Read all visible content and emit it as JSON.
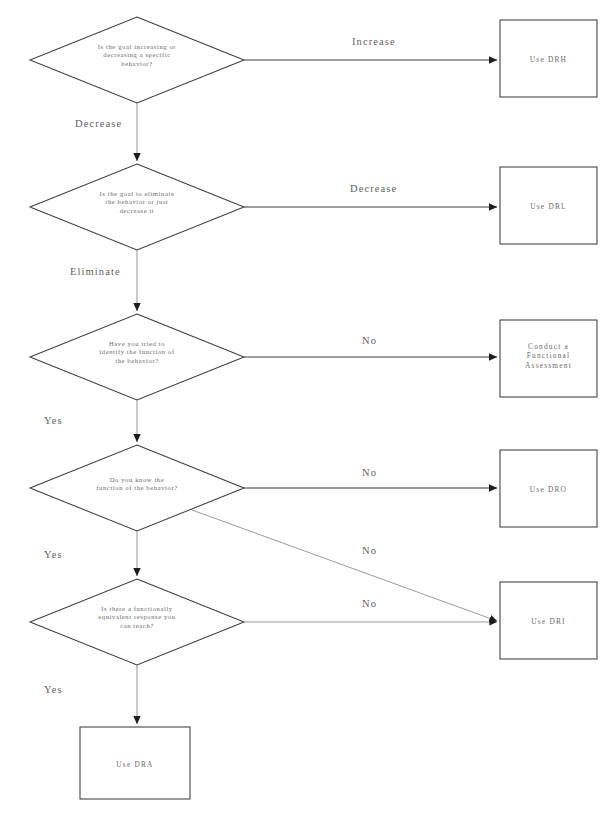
{
  "diagram": {
    "type": "flowchart",
    "stroke_color": "#3d3d3d",
    "thin_stroke_color": "#8a8a8a",
    "text_color": "#6b6b6b",
    "background": "#ffffff",
    "decisions": [
      {
        "id": "d1",
        "lines": [
          "Is the goal increasing or",
          "decreasing a specific",
          "behavior?"
        ],
        "cx": 137,
        "cy": 60,
        "rx": 107,
        "ry": 43
      },
      {
        "id": "d2",
        "lines": [
          "Is the goal to eliminate",
          "the behavior or just",
          "decrease it"
        ],
        "cx": 137,
        "cy": 207,
        "rx": 107,
        "ry": 43
      },
      {
        "id": "d3",
        "lines": [
          "Have you tried to",
          "identify the function of",
          "the behavior?"
        ],
        "cx": 137,
        "cy": 357,
        "rx": 107,
        "ry": 43
      },
      {
        "id": "d4",
        "lines": [
          "Do you know the",
          "function of the behavior?"
        ],
        "cx": 137,
        "cy": 488,
        "rx": 107,
        "ry": 43
      },
      {
        "id": "d5",
        "lines": [
          "Is there a functionally",
          "equivalent response you",
          "can teach?"
        ],
        "cx": 137,
        "cy": 622,
        "rx": 107,
        "ry": 43
      }
    ],
    "outcomes": [
      {
        "id": "o1",
        "lines": [
          "Use DRH"
        ],
        "x": 500,
        "y": 20,
        "w": 97,
        "h": 77
      },
      {
        "id": "o2",
        "lines": [
          "Use DRL"
        ],
        "x": 500,
        "y": 167,
        "w": 97,
        "h": 77
      },
      {
        "id": "o3",
        "lines": [
          "Conduct a",
          "Functional",
          "Assessment"
        ],
        "x": 500,
        "y": 320,
        "w": 97,
        "h": 77
      },
      {
        "id": "o4",
        "lines": [
          "Use DRO"
        ],
        "x": 500,
        "y": 450,
        "w": 97,
        "h": 77
      },
      {
        "id": "o5",
        "lines": [
          "Use DRI"
        ],
        "x": 500,
        "y": 582,
        "w": 97,
        "h": 77
      },
      {
        "id": "o6",
        "lines": [
          "Use DRA"
        ],
        "x": 80,
        "y": 727,
        "w": 110,
        "h": 72
      }
    ],
    "edge_labels": [
      {
        "id": "e1",
        "text": "Increase",
        "x": 352,
        "y": 36,
        "orientation": "horizontal"
      },
      {
        "id": "e2",
        "text": "Decrease",
        "x": 75,
        "y": 118,
        "orientation": "vertical"
      },
      {
        "id": "e3",
        "text": "Decrease",
        "x": 350,
        "y": 183,
        "orientation": "horizontal"
      },
      {
        "id": "e4",
        "text": "Eliminate",
        "x": 70,
        "y": 266,
        "orientation": "vertical"
      },
      {
        "id": "e5",
        "text": "No",
        "x": 362,
        "y": 335,
        "orientation": "horizontal"
      },
      {
        "id": "e6",
        "text": "Yes",
        "x": 44,
        "y": 415,
        "orientation": "vertical"
      },
      {
        "id": "e7",
        "text": "No",
        "x": 362,
        "y": 467,
        "orientation": "horizontal"
      },
      {
        "id": "e8",
        "text": "Yes",
        "x": 44,
        "y": 549,
        "orientation": "vertical"
      },
      {
        "id": "e9",
        "text": "No",
        "x": 362,
        "y": 545,
        "orientation": "diagonal"
      },
      {
        "id": "e10",
        "text": "No",
        "x": 362,
        "y": 598,
        "orientation": "horizontal"
      },
      {
        "id": "e11",
        "text": "Yes",
        "x": 44,
        "y": 684,
        "orientation": "vertical"
      }
    ]
  }
}
